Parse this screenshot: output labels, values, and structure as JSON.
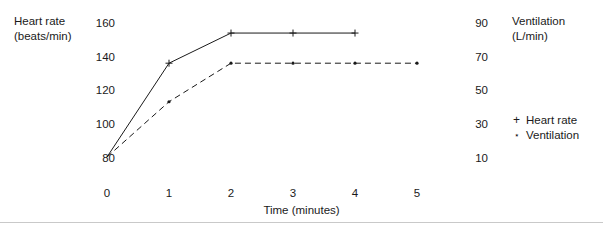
{
  "chart_data": {
    "type": "line",
    "title": "",
    "xlabel": "Time (minutes)",
    "x_ticks": [
      "0",
      "1",
      "2",
      "3",
      "4",
      "5"
    ],
    "x": [
      0,
      1,
      2,
      3,
      4,
      5
    ],
    "xlim": [
      0,
      5
    ],
    "grid": false,
    "legend_position": "right",
    "axes": [
      {
        "id": "left",
        "label_line1": "Heart rate",
        "label_line2": "(beats/min)",
        "ticks": [
          "160",
          "140",
          "120",
          "100",
          "80"
        ],
        "tick_values": [
          160,
          140,
          120,
          100,
          80
        ],
        "ylim": [
          80,
          160
        ]
      },
      {
        "id": "right",
        "label_line1": "Ventilation",
        "label_line2": "(L/min)",
        "ticks": [
          "90",
          "70",
          "50",
          "30",
          "10"
        ],
        "tick_values": [
          90,
          70,
          50,
          30,
          10
        ],
        "ylim": [
          10,
          90
        ]
      }
    ],
    "series": [
      {
        "name": "Heart rate",
        "axis": "left",
        "marker": "plus",
        "line_style": "solid",
        "x": [
          0,
          1,
          2,
          3,
          4
        ],
        "values": [
          80,
          136,
          154,
          154,
          154
        ]
      },
      {
        "name": "Ventilation",
        "axis": "right",
        "marker": "star",
        "line_style": "dashed",
        "x": [
          0,
          1,
          2,
          3,
          4,
          5
        ],
        "values": [
          10,
          43,
          66,
          66,
          66,
          66
        ]
      }
    ],
    "legend": [
      {
        "marker": "+",
        "label": "Heart rate"
      },
      {
        "marker": "⋆",
        "label": "Ventilation"
      }
    ],
    "colors": {
      "ink": "#1a1a1a",
      "rule": "#c9c9c9",
      "background": "#ffffff"
    }
  }
}
